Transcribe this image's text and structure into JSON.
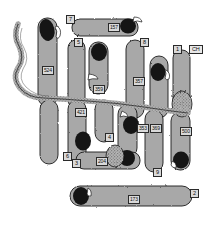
{
  "figure": {
    "type": "chromosome-idiogram",
    "background_color": "#ffffff",
    "body_fill": "#a8a8a8",
    "centromere_fill": "#151515",
    "outline_color": "#1a1a1a",
    "label_fill": "#d9d9d9"
  },
  "group_labels": [
    {
      "id": "g7",
      "text": "7",
      "x": 66,
      "y": 15
    },
    {
      "id": "g5",
      "text": "5",
      "x": 74,
      "y": 38
    },
    {
      "id": "g8",
      "text": "8",
      "x": 140,
      "y": 38
    },
    {
      "id": "g1",
      "text": "1",
      "x": 173,
      "y": 45
    },
    {
      "id": "gch",
      "text": "CH",
      "x": 189,
      "y": 45
    },
    {
      "id": "g4",
      "text": "4",
      "x": 105,
      "y": 133
    },
    {
      "id": "g6",
      "text": "6",
      "x": 63,
      "y": 152
    },
    {
      "id": "g3",
      "text": "3",
      "x": 72,
      "y": 159
    },
    {
      "id": "g9",
      "text": "9",
      "x": 153,
      "y": 168
    },
    {
      "id": "g2",
      "text": "2",
      "x": 190,
      "y": 189
    }
  ],
  "measurement_labels": [
    {
      "id": "m524",
      "text": "524",
      "x": 42,
      "y": 66
    },
    {
      "id": "m157",
      "text": "157",
      "x": 108,
      "y": 23
    },
    {
      "id": "m359",
      "text": "359",
      "x": 93,
      "y": 85
    },
    {
      "id": "m357",
      "text": "357",
      "x": 133,
      "y": 77
    },
    {
      "id": "m421",
      "text": "421",
      "x": 75,
      "y": 108
    },
    {
      "id": "m353",
      "text": "353",
      "x": 137,
      "y": 124
    },
    {
      "id": "m369",
      "text": "369",
      "x": 150,
      "y": 124
    },
    {
      "id": "m500",
      "text": "500",
      "x": 180,
      "y": 127
    },
    {
      "id": "m204",
      "text": "204",
      "x": 96,
      "y": 157
    },
    {
      "id": "m173",
      "text": "173",
      "x": 128,
      "y": 195
    }
  ]
}
